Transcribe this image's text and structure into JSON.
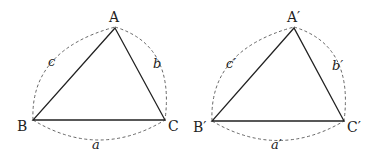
{
  "figure": {
    "triangles": [
      {
        "name": "triangle-abc",
        "vertices": {
          "A": "A",
          "B": "B",
          "C": "C"
        },
        "sides": {
          "a": "a",
          "b": "b",
          "c": "c"
        }
      },
      {
        "name": "triangle-abc-prime",
        "vertices": {
          "A": "A′",
          "B": "B′",
          "C": "C′"
        },
        "sides": {
          "a": "a′",
          "b": "b′",
          "c": "c′"
        }
      }
    ],
    "colors": {
      "stroke": "#222222",
      "dashed": "#555555",
      "background": "#ffffff"
    }
  }
}
